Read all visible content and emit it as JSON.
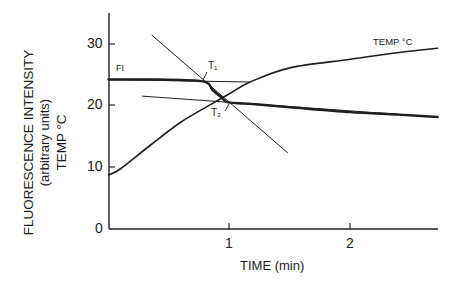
{
  "chart_data": {
    "type": "line",
    "title": "",
    "xlabel": "TIME (min)",
    "ylabel_lines": [
      "FLUORESCENCE INTENSITY",
      "(arbitrary units)",
      "TEMP °C"
    ],
    "xlim": [
      0,
      2.73
    ],
    "ylim": [
      0,
      35
    ],
    "x_ticks": [
      1,
      2
    ],
    "x_tick_labels": [
      "1",
      "2"
    ],
    "y_ticks": [
      0,
      10,
      20,
      30
    ],
    "y_tick_labels": [
      "0",
      "10",
      "20",
      "30"
    ],
    "grid": false,
    "legend": "none (inline curve labels)",
    "series": [
      {
        "name": "FI",
        "label": "FI",
        "style": "thick",
        "x": [
          0,
          0.4,
          0.78,
          0.86,
          0.94,
          0.99,
          1.2,
          1.5,
          2.0,
          2.4,
          2.72
        ],
        "y": [
          24.3,
          24.3,
          24.0,
          22.6,
          21.3,
          20.6,
          20.3,
          19.8,
          19.0,
          18.6,
          18.2
        ]
      },
      {
        "name": "TEMP °C",
        "label": "TEMP °C",
        "style": "medium",
        "x": [
          0,
          0.1,
          0.35,
          0.6,
          0.85,
          1.0,
          1.17,
          1.5,
          2.0,
          2.4,
          2.72
        ],
        "y": [
          8.8,
          9.8,
          13.7,
          17.4,
          20.3,
          22.0,
          23.9,
          26.2,
          27.6,
          28.7,
          29.4
        ]
      },
      {
        "name": "Upper FI extrapolation",
        "style": "thin",
        "x": [
          0,
          1.16
        ],
        "y": [
          24.3,
          23.9
        ]
      },
      {
        "name": "Lower FI extrapolation",
        "style": "thin",
        "x": [
          0.28,
          2.72
        ],
        "y": [
          21.6,
          18.2
        ]
      },
      {
        "name": "Transition tangent",
        "style": "thin",
        "x": [
          0.36,
          1.48
        ],
        "y": [
          31.5,
          12.4
        ]
      }
    ],
    "annotations": [
      {
        "text": "T₁",
        "x": 0.79,
        "y": 24.0,
        "note": "intersection of upper extrapolation and tangent"
      },
      {
        "text": "T₂",
        "x": 0.99,
        "y": 20.6,
        "note": "intersection of lower extrapolation and tangent"
      },
      {
        "text": "FI",
        "x": 0.05,
        "y": 26.0
      },
      {
        "text": "TEMP °C",
        "x": 2.05,
        "y": 30.5
      }
    ]
  },
  "labels": {
    "ylabel1": "FLUORESCENCE INTENSITY",
    "ylabel2": "(arbitrary units)",
    "ylabel3": "TEMP °C",
    "xlabel": "TIME (min)",
    "fi": "FI",
    "temp": "TEMP °C",
    "t1": "T₁",
    "t2": "T₂",
    "y0": "0",
    "y10": "10",
    "y20": "20",
    "y30": "30",
    "x1": "1",
    "x2": "2"
  }
}
